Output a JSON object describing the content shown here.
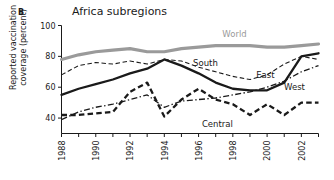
{
  "panel": {
    "letter": "B"
  },
  "chart_data": {
    "type": "line",
    "title": "Africa subregions",
    "xlabel": "",
    "ylabel": "Reported vaccination\ncoverage (percent)",
    "ylim": [
      30,
      100
    ],
    "yticks": [
      40,
      60,
      80,
      100
    ],
    "ytick_labels": [
      "40",
      "60",
      "80",
      "100"
    ],
    "xlim": [
      1988,
      2003
    ],
    "x": [
      1988,
      1989,
      1990,
      1991,
      1992,
      1993,
      1994,
      1995,
      1996,
      1997,
      1998,
      1999,
      2000,
      2001,
      2002,
      2003
    ],
    "xticks": [
      1988,
      1989,
      1990,
      1991,
      1992,
      1993,
      1994,
      1995,
      1996,
      1997,
      1998,
      1999,
      2000,
      2001,
      2002,
      2003
    ],
    "xtick_labels": [
      "1988",
      "",
      "1990",
      "",
      "1992",
      "",
      "1994",
      "",
      "1996",
      "",
      "1998",
      "",
      "2000",
      "",
      "2002",
      ""
    ],
    "grid": false,
    "legend_position": "inline-labels",
    "series": [
      {
        "name": "World",
        "label": "World",
        "color": "#9a9a9a",
        "style": "solid-thick",
        "values": [
          78,
          81,
          83,
          84,
          85,
          83,
          83,
          85,
          86,
          87,
          87,
          87,
          86,
          86,
          87,
          88
        ]
      },
      {
        "name": "South",
        "label": "South",
        "color": "#1a1a1a",
        "style": "dashed-thin",
        "values": [
          68,
          74,
          76,
          75,
          77,
          75,
          78,
          77,
          73,
          70,
          67,
          65,
          68,
          75,
          80,
          78
        ]
      },
      {
        "name": "East",
        "label": "East",
        "color": "#1a1a1a",
        "style": "solid-thick-black",
        "values": [
          55,
          59,
          62,
          65,
          69,
          72,
          78,
          74,
          69,
          63,
          59,
          58,
          58,
          63,
          80,
          82
        ]
      },
      {
        "name": "West",
        "label": "West",
        "color": "#1a1a1a",
        "style": "dash-dot",
        "values": [
          39,
          44,
          47,
          49,
          52,
          55,
          47,
          51,
          52,
          53,
          55,
          57,
          60,
          64,
          70,
          74
        ]
      },
      {
        "name": "Central",
        "label": "Central",
        "color": "#1a1a1a",
        "style": "dashed-thick",
        "values": [
          42,
          42,
          43,
          44,
          57,
          63,
          41,
          52,
          59,
          52,
          49,
          42,
          49,
          42,
          50,
          50
        ]
      }
    ],
    "annotations": [
      {
        "text": "World",
        "x": 1998.1,
        "y": 92.5
      },
      {
        "text": "South",
        "x": 1996.4,
        "y": 74.0
      },
      {
        "text": "East",
        "x": 1999.9,
        "y": 66.0
      },
      {
        "text": "West",
        "x": 2001.6,
        "y": 58.0
      },
      {
        "text": "Central",
        "x": 1997.1,
        "y": 34.5
      }
    ]
  }
}
